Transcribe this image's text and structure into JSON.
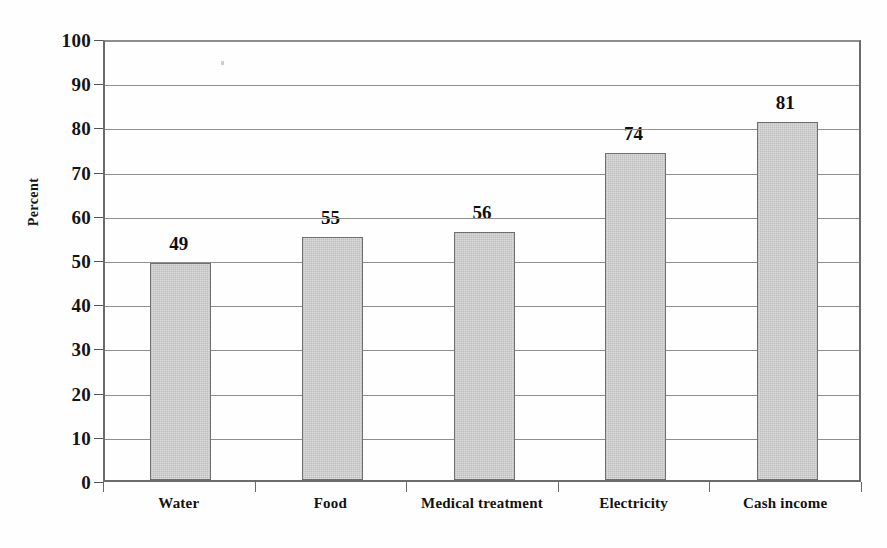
{
  "chart_data": {
    "type": "bar",
    "title": "",
    "xlabel": "",
    "ylabel": "Percent",
    "ylim": [
      0,
      100
    ],
    "ytick_step": 10,
    "grid": true,
    "legend": "none",
    "categories": [
      "Water",
      "Food",
      "Medical treatment",
      "Electricity",
      "Cash income"
    ],
    "values": [
      49,
      55,
      56,
      74,
      81
    ],
    "value_labels": [
      "49",
      "55",
      "56",
      "74",
      "81"
    ],
    "ytick_labels": [
      "100",
      "90",
      "80",
      "70",
      "60",
      "50",
      "40",
      "30",
      "20",
      "10",
      "0"
    ],
    "bar_color": "#c9c9c9",
    "bar_border_color": "#6f6f6f",
    "grid_color": "#8f8f8f",
    "axis_color": "#6b6b6b",
    "text_color": "#121212",
    "background_color": "#fefefe"
  }
}
